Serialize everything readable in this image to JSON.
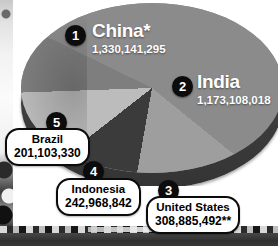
{
  "figure": {
    "type": "pie-3d"
  },
  "chart_data": {
    "type": "pie",
    "title": "",
    "subtitle": "",
    "xlabel": "",
    "ylabel": "",
    "legend_position": "inline-callouts",
    "grid": false,
    "units": "people",
    "categories": [
      "China*",
      "India",
      "United States",
      "Indonesia",
      "Brazil"
    ],
    "values": [
      1330141295,
      1173108018,
      308885492,
      242968842,
      201103330
    ],
    "value_labels": [
      "1,330,141,295",
      "1,173,108,018",
      "308,885,492**",
      "242,968,842",
      "201,103,330"
    ],
    "ranks": [
      "1",
      "2",
      "3",
      "4",
      "5"
    ],
    "colors": [
      "#8b8b8b",
      "#9e9e9e",
      "#3b3b3b",
      "#bcbcbc",
      "#7e7e7e"
    ],
    "annotations": [
      "*",
      "**"
    ]
  },
  "slices": [
    {
      "rank": "1",
      "name": "China*",
      "value": "1,330,141,295",
      "color": "#8b8b8b"
    },
    {
      "rank": "2",
      "name": "India",
      "value": "1,173,108,018",
      "color": "#9e9e9e"
    },
    {
      "rank": "3",
      "name": "United States",
      "value": "308,885,492**",
      "color": "#3b3b3b"
    },
    {
      "rank": "4",
      "name": "Indonesia",
      "value": "242,968,842",
      "color": "#bcbcbc"
    },
    {
      "rank": "5",
      "name": "Brazil",
      "value": "201,103,330",
      "color": "#7e7e7e"
    }
  ]
}
